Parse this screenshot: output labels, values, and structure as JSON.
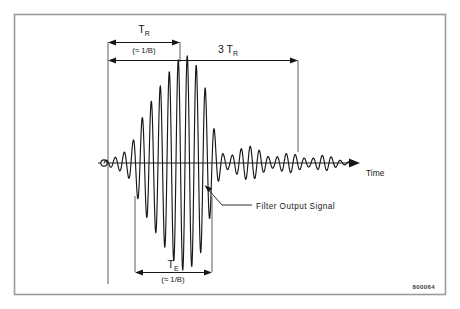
{
  "figure": {
    "id_label": "800064",
    "frame_color": "#9a9a9a",
    "background": "#ffffff",
    "ink_color": "#17171a"
  },
  "axis": {
    "time_label": "Time",
    "origin_marker": "origin-circle"
  },
  "dimensions": {
    "tr": {
      "symbol": "T",
      "subscript": "R",
      "note": "(≈ 1/B)"
    },
    "three_tr": {
      "multiplier": "3 ",
      "symbol": "T",
      "subscript": "R"
    },
    "te": {
      "symbol": "T",
      "subscript": "E",
      "note": "(≈ 1/B)"
    }
  },
  "annotations": {
    "filter_output": "Filter Output Signal"
  },
  "chart_data": {
    "type": "line",
    "title": "",
    "xlabel": "Time",
    "ylabel": "",
    "baseline_y": 163,
    "x_start": 104,
    "x_end": 352,
    "peak_x": 185,
    "peak_amplitude": 108,
    "carrier_period_px": 9.0,
    "grid": false,
    "legend": false,
    "envelope": [
      {
        "x": 104,
        "a": 2
      },
      {
        "x": 110,
        "a": 4
      },
      {
        "x": 116,
        "a": 6
      },
      {
        "x": 122,
        "a": 9
      },
      {
        "x": 128,
        "a": 14
      },
      {
        "x": 133,
        "a": 22
      },
      {
        "x": 137,
        "a": 34
      },
      {
        "x": 142,
        "a": 45
      },
      {
        "x": 147,
        "a": 55
      },
      {
        "x": 152,
        "a": 63
      },
      {
        "x": 157,
        "a": 72
      },
      {
        "x": 162,
        "a": 80
      },
      {
        "x": 167,
        "a": 88
      },
      {
        "x": 172,
        "a": 96
      },
      {
        "x": 177,
        "a": 102
      },
      {
        "x": 182,
        "a": 107
      },
      {
        "x": 186,
        "a": 108
      },
      {
        "x": 190,
        "a": 106
      },
      {
        "x": 195,
        "a": 100
      },
      {
        "x": 200,
        "a": 92
      },
      {
        "x": 204,
        "a": 80
      },
      {
        "x": 208,
        "a": 64
      },
      {
        "x": 212,
        "a": 44
      },
      {
        "x": 216,
        "a": 26
      },
      {
        "x": 220,
        "a": 14
      },
      {
        "x": 224,
        "a": 8
      },
      {
        "x": 229,
        "a": 6
      },
      {
        "x": 234,
        "a": 9
      },
      {
        "x": 239,
        "a": 13
      },
      {
        "x": 244,
        "a": 16
      },
      {
        "x": 249,
        "a": 17
      },
      {
        "x": 254,
        "a": 16
      },
      {
        "x": 259,
        "a": 13
      },
      {
        "x": 264,
        "a": 9
      },
      {
        "x": 269,
        "a": 6
      },
      {
        "x": 274,
        "a": 5
      },
      {
        "x": 279,
        "a": 7
      },
      {
        "x": 284,
        "a": 9
      },
      {
        "x": 289,
        "a": 10
      },
      {
        "x": 294,
        "a": 9
      },
      {
        "x": 299,
        "a": 7
      },
      {
        "x": 304,
        "a": 5
      },
      {
        "x": 309,
        "a": 4
      },
      {
        "x": 314,
        "a": 5
      },
      {
        "x": 319,
        "a": 7
      },
      {
        "x": 324,
        "a": 8
      },
      {
        "x": 329,
        "a": 7
      },
      {
        "x": 334,
        "a": 5
      },
      {
        "x": 339,
        "a": 3
      },
      {
        "x": 344,
        "a": 2
      },
      {
        "x": 352,
        "a": 1
      }
    ],
    "markers": {
      "tr_left_x": 108,
      "tr_right_x": 180,
      "three_tr_left_x": 108,
      "three_tr_right_x": 298,
      "te_left_x": 135,
      "te_right_x": 212
    }
  }
}
